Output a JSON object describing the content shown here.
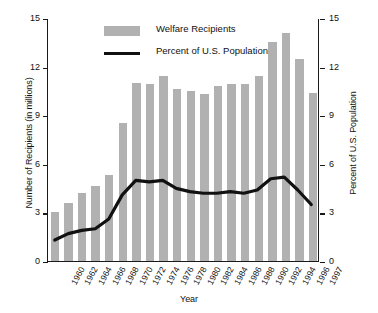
{
  "chart_data": {
    "type": "bar",
    "title": "",
    "xlabel": "Year",
    "ylabel": "Number of Recipients (in millions)",
    "ylabel_right": "Percent of U.S. Population",
    "ylim": [
      0,
      15
    ],
    "ylim_right": [
      0,
      15
    ],
    "yticks": [
      "0",
      "3",
      "6",
      "9",
      "12",
      "15"
    ],
    "ytick_values": [
      0,
      3,
      6,
      9,
      12,
      15
    ],
    "yticks_right": [
      "0",
      "3",
      "6",
      "9",
      "12",
      "15"
    ],
    "ytick_values_right": [
      0,
      3,
      6,
      9,
      12,
      15
    ],
    "grid": false,
    "legend_position": "top-center",
    "categories": [
      "1960",
      "1962",
      "1964",
      "1966",
      "1968",
      "1970",
      "1972",
      "1974",
      "1976",
      "1978",
      "1980",
      "1982",
      "1984",
      "1986",
      "1988",
      "1990",
      "1992",
      "1994",
      "1996",
      "1997"
    ],
    "series": [
      {
        "name": "Welfare Recipients",
        "type": "bar",
        "color": "#b1b1b1",
        "axis": "left",
        "units": "millions",
        "values": [
          3.0,
          3.6,
          4.2,
          4.6,
          5.3,
          8.5,
          11.0,
          10.9,
          11.4,
          10.6,
          10.5,
          10.3,
          10.8,
          10.9,
          10.9,
          11.4,
          13.5,
          14.1,
          12.5,
          10.4
        ]
      },
      {
        "name": "Percent of U.S. Population",
        "type": "line",
        "color": "#111111",
        "axis": "right",
        "units": "percent",
        "values": [
          1.3,
          1.7,
          1.9,
          2.0,
          2.6,
          4.1,
          5.0,
          4.9,
          5.0,
          4.5,
          4.3,
          4.2,
          4.2,
          4.3,
          4.2,
          4.4,
          5.1,
          5.2,
          4.4,
          3.5
        ]
      }
    ]
  },
  "legend": {
    "items": [
      {
        "label": "Welfare Recipients",
        "marker": "bar-swatch"
      },
      {
        "label": "Percent of U.S. Population",
        "marker": "line-swatch"
      }
    ]
  }
}
